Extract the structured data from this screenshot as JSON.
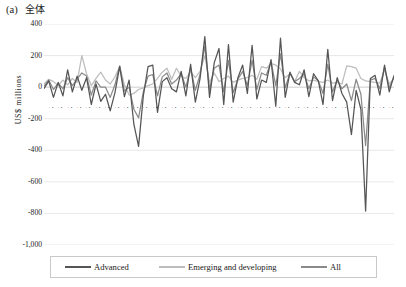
{
  "panel": {
    "tag": "(a)",
    "title": "全体"
  },
  "axes": {
    "ylabel": "US$ millions",
    "yticks": [
      "400",
      "200",
      "0",
      "-200",
      "-400",
      "-600",
      "-800",
      "-1,000"
    ],
    "ytick_values": [
      400,
      200,
      0,
      -200,
      -400,
      -600,
      -800,
      -1000
    ],
    "ylim": [
      -1000,
      400
    ],
    "xlabel": ""
  },
  "legend": {
    "position": "bottom",
    "items": [
      {
        "label": "Advanced",
        "color": "#555555"
      },
      {
        "label": "Emerging and developing",
        "color": "#bdbdbd"
      },
      {
        "label": "All",
        "color": "#8a8a8a"
      }
    ]
  },
  "colors": {
    "advanced": "#555555",
    "emerging": "#bdbdbd",
    "all": "#8a8a8a",
    "gridline": "#d9d9d9",
    "axis": "#bfbfbf",
    "text": "#1a1a1a"
  },
  "chart_data": {
    "type": "line",
    "xlabel": "",
    "ylabel": "US$ millions",
    "ylim": [
      -1000,
      400
    ],
    "ytick_step": 200,
    "grid": true,
    "legend_position": "bottom",
    "categories": [
      "2004Q1",
      "2004Q2",
      "2004Q3",
      "2004Q4",
      "2005Q1",
      "2005Q2",
      "2005Q3",
      "2005Q4",
      "2006Q1",
      "2006Q2",
      "2006Q3",
      "2006Q4",
      "2007Q1",
      "2007Q2",
      "2007Q3",
      "2007Q4",
      "2008Q1",
      "2008Q2",
      "2008Q3",
      "2008Q4",
      "2009Q1",
      "2009Q2",
      "2009Q3",
      "2009Q4",
      "2010Q1",
      "2010Q2",
      "2010Q3",
      "2010Q4",
      "2011Q1",
      "2011Q2",
      "2011Q3",
      "2011Q4",
      "2012Q1",
      "2012Q2",
      "2012Q3",
      "2012Q4",
      "2013Q1",
      "2013Q2",
      "2013Q3",
      "2013Q4",
      "2014Q1",
      "2014Q2",
      "2014Q3",
      "2014Q4",
      "2015Q1",
      "2015Q2",
      "2015Q3",
      "2015Q4",
      "2016Q1",
      "2016Q2",
      "2016Q3",
      "2016Q4",
      "2017Q1",
      "2017Q2",
      "2017Q3",
      "2017Q4",
      "2018Q1",
      "2018Q2",
      "2018Q3",
      "2018Q4",
      "2019Q1",
      "2019Q2",
      "2019Q3",
      "2019Q4",
      "2020Q1",
      "2020Q2",
      "2020Q3",
      "2020Q4",
      "2021Q1",
      "2021Q2",
      "2021Q3",
      "2021Q4",
      "2022Q1",
      "2022Q2",
      "2022Q3"
    ],
    "xtick_labels_shown": [
      "2004Q1",
      "2004Q3",
      "2005Q1",
      "2005Q3",
      "2006Q1",
      "2006Q3",
      "2007Q1",
      "2007Q3",
      "2008Q1",
      "2008Q3",
      "2009Q1",
      "2009Q3",
      "2010Q1",
      "2010Q3",
      "2011Q1",
      "2011Q3",
      "2012Q1",
      "2012Q3",
      "2013Q1",
      "2013Q3",
      "2014Q1",
      "2014Q3",
      "2015Q1",
      "2015Q3",
      "2016Q1",
      "2016Q3",
      "2017Q1",
      "2017Q3",
      "2018Q1",
      "2018Q3",
      "2019Q1",
      "2019Q3",
      "2020Q1",
      "2020Q3",
      "2021Q1",
      "2021Q3",
      "2022Q1",
      "2022Q3"
    ],
    "series": [
      {
        "name": "Advanced",
        "color": "#555555",
        "values": [
          -10,
          40,
          -65,
          30,
          -55,
          110,
          -30,
          70,
          -20,
          60,
          -110,
          20,
          -90,
          -45,
          -150,
          -35,
          130,
          -60,
          45,
          -235,
          -375,
          -55,
          130,
          140,
          -160,
          35,
          60,
          -10,
          -30,
          100,
          -55,
          145,
          -95,
          55,
          320,
          -65,
          155,
          245,
          -110,
          270,
          -95,
          60,
          140,
          -40,
          265,
          -75,
          45,
          30,
          175,
          -120,
          310,
          -65,
          95,
          30,
          15,
          110,
          -60,
          85,
          40,
          -110,
          240,
          -85,
          60,
          -40,
          -95,
          -300,
          -20,
          -140,
          -785,
          55,
          75,
          -50,
          140,
          -30,
          75
        ]
      },
      {
        "name": "Emerging and developing",
        "color": "#bdbdbd",
        "values": [
          20,
          50,
          35,
          10,
          45,
          15,
          55,
          30,
          200,
          85,
          10,
          55,
          95,
          45,
          20,
          65,
          130,
          15,
          -50,
          -40,
          -15,
          -5,
          10,
          20,
          55,
          95,
          120,
          50,
          120,
          70,
          55,
          95,
          60,
          100,
          200,
          30,
          90,
          35,
          55,
          70,
          30,
          45,
          55,
          60,
          75,
          50,
          130,
          120,
          150,
          140,
          115,
          60,
          85,
          35,
          100,
          60,
          40,
          45,
          35,
          30,
          45,
          25,
          30,
          20,
          135,
          130,
          120,
          55,
          40,
          35,
          30,
          25,
          110,
          20,
          55
        ]
      },
      {
        "name": "All",
        "color": "#8a8a8a",
        "values": [
          5,
          45,
          -15,
          25,
          -10,
          60,
          10,
          50,
          90,
          70,
          -50,
          40,
          0,
          0,
          -65,
          15,
          135,
          -25,
          0,
          -140,
          -195,
          -30,
          70,
          80,
          -55,
          65,
          90,
          20,
          45,
          85,
          0,
          120,
          -20,
          80,
          260,
          -15,
          120,
          140,
          -30,
          170,
          -35,
          50,
          100,
          10,
          170,
          -15,
          90,
          75,
          160,
          10,
          210,
          -5,
          90,
          35,
          55,
          85,
          -10,
          65,
          40,
          -40,
          145,
          -30,
          45,
          -10,
          20,
          -85,
          50,
          -45,
          -370,
          45,
          55,
          -10,
          125,
          -5,
          65
        ]
      }
    ]
  }
}
